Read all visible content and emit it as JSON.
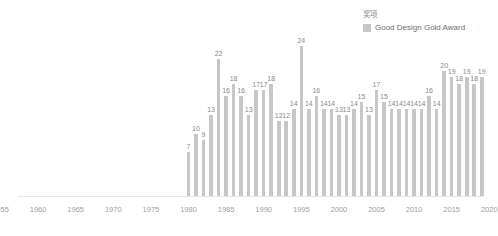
{
  "legend": {
    "title": "奖项",
    "position": "top-right",
    "entries": [
      {
        "label": "Good Design Gold Award",
        "color": "#c7c7c7",
        "swatch_name": "legend-swatch-good-design-gold-award"
      }
    ]
  },
  "axis": {
    "x_tick_labels": [
      "1955",
      "1960",
      "1965",
      "1970",
      "1975",
      "1980",
      "1985",
      "1990",
      "1995",
      "2000",
      "2005",
      "2010",
      "2015",
      "2020"
    ]
  },
  "chart_data": {
    "type": "bar",
    "title": "",
    "subtitle": "",
    "xlabel": "",
    "ylabel": "",
    "grid": false,
    "legend_position": "top-right",
    "xlim": [
      1953,
      2021
    ],
    "ylim": [
      0,
      24
    ],
    "x_ticks": [
      1955,
      1960,
      1965,
      1970,
      1975,
      1980,
      1985,
      1990,
      1995,
      2000,
      2005,
      2010,
      2015,
      2020
    ],
    "categories": [
      "1980",
      "1981",
      "1982",
      "1983",
      "1984",
      "1985",
      "1986",
      "1987",
      "1988",
      "1989",
      "1990",
      "1991",
      "1992",
      "1993",
      "1994",
      "1995",
      "1996",
      "1997",
      "1998",
      "1999",
      "2000",
      "2001",
      "2002",
      "2003",
      "2004",
      "2005",
      "2006",
      "2007",
      "2008",
      "2009",
      "2010",
      "2011",
      "2012",
      "2013",
      "2014",
      "2015",
      "2016",
      "2017",
      "2018",
      "2019"
    ],
    "series": [
      {
        "name": "Good Design Gold Award",
        "color": "#c7c7c7",
        "values": [
          7,
          10,
          9,
          13,
          22,
          16,
          18,
          16,
          13,
          17,
          17,
          18,
          12,
          12,
          14,
          24,
          14,
          16,
          14,
          14,
          13,
          13,
          14,
          15,
          13,
          17,
          15,
          14,
          14,
          14,
          14,
          14,
          16,
          14,
          20,
          19,
          18,
          19,
          18,
          19
        ]
      }
    ]
  }
}
